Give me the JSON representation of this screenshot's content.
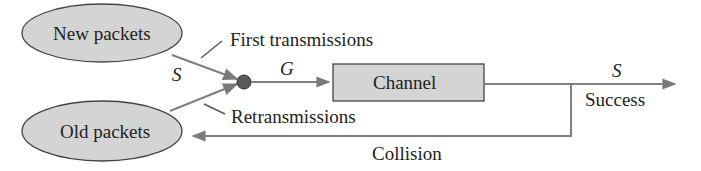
{
  "nodes": {
    "new_packets": {
      "label": "New packets"
    },
    "old_packets": {
      "label": "Old packets"
    },
    "channel": {
      "label": "Channel"
    }
  },
  "labels": {
    "first_transmissions": "First transmissions",
    "retransmissions": "Retransmissions",
    "success": "Success",
    "collision": "Collision",
    "s_input": "S",
    "g_offered": "G",
    "s_output": "S"
  },
  "colors": {
    "node_fill": "#d4d4d4",
    "stroke": "#555555",
    "arrow": "#808080",
    "junction": "#5a5a5a"
  }
}
